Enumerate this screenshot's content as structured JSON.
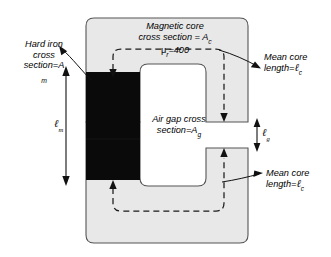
{
  "figure": {
    "type": "engineering-diagram",
    "colors": {
      "core_fill": "#e8e8e8",
      "core_stroke": "#555555",
      "hard_iron_fill": "#0a0a0a",
      "background": "#ffffff",
      "flux_path_stroke": "#1a1a1a",
      "leader_stroke": "#1a1a1a"
    }
  },
  "labels": {
    "magnetic_core": {
      "line1": "Magnetic core",
      "line2_prefix": "cross section = ",
      "line2_symbol": "A",
      "line2_subscript": "c"
    },
    "permeability": {
      "mu": "μ",
      "mu_subscript": "r",
      "equals_value": "=400"
    },
    "hard_iron": {
      "line1": "Hard iron",
      "line2": "cross",
      "line3_prefix": "section=",
      "line3_symbol": "A",
      "subscript_standalone": "m"
    },
    "air_gap": {
      "line1": "Air gap cross",
      "line2_prefix": "section=",
      "line2_symbol": "A",
      "line2_subscript": "g"
    },
    "mean_core_top": {
      "line1": "Mean core",
      "line2_prefix": "length=",
      "line2_symbol": "ℓ",
      "line2_subscript": "c"
    },
    "mean_core_bottom": {
      "line1": "Mean core",
      "line2_prefix": "length=",
      "line2_symbol": "ℓ",
      "line2_subscript": "c"
    },
    "dim_lm": {
      "symbol": "ℓ",
      "subscript": "m"
    },
    "dim_lg": {
      "symbol": "ℓ",
      "subscript": "g"
    }
  }
}
